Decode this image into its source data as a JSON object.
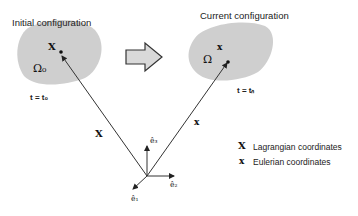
{
  "initial": {
    "title": "Initial configuration",
    "domain": "Ω₀",
    "point": "X",
    "time": "t = t₀"
  },
  "current": {
    "title": "Current configuration",
    "domain": "Ω",
    "point": "x",
    "time": "t = tₙ"
  },
  "vectors": {
    "lagrangian": "X",
    "eulerian": "x"
  },
  "basis": {
    "e1": "ê₁",
    "e2": "ê₂",
    "e3": "ê₃"
  },
  "legend": [
    {
      "symbol": "X",
      "label": "Lagrangian coordinates"
    },
    {
      "symbol": "x",
      "label": "Eulerian coordinates"
    }
  ],
  "colors": {
    "blob": "#cfcfcf",
    "arrow_fill": "#d9d9d9",
    "line": "#333333"
  }
}
